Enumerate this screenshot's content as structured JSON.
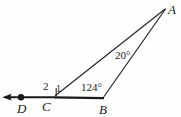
{
  "figure": {
    "background_color": "#fefefe",
    "stroke_color": "#1a1a1a",
    "points": {
      "A": {
        "label": "A",
        "x": 165,
        "y": 8
      },
      "B": {
        "label": "B",
        "x": 103,
        "y": 97
      },
      "C": {
        "label": "C",
        "x": 53,
        "y": 97
      },
      "D": {
        "label": "D",
        "x": 21,
        "y": 97
      },
      "arrow_tip": {
        "x": 3,
        "y": 97
      }
    },
    "segments": [
      {
        "name": "ray-CD",
        "from": "C",
        "to": "arrow_tip",
        "arrow": true
      },
      {
        "name": "segment-CB",
        "from": "C",
        "to": "B",
        "arrow": false
      },
      {
        "name": "segment-CA",
        "from": "C",
        "to": "A",
        "arrow": false
      },
      {
        "name": "segment-BA",
        "from": "B",
        "to": "A",
        "arrow": false
      }
    ],
    "angles": [
      {
        "name": "angle-2",
        "label": "2",
        "vertex": "C",
        "position": "left-of-C-above-ray"
      },
      {
        "name": "angle-1",
        "label": "1",
        "vertex": "C",
        "position": "right-of-C-above-ray"
      },
      {
        "name": "angle-B-exterior",
        "label": "124°",
        "vertex": "B",
        "value": 124,
        "unit": "degrees"
      },
      {
        "name": "angle-A",
        "label": "20°",
        "vertex": "A",
        "value": 20,
        "unit": "degrees"
      }
    ],
    "markers": [
      {
        "name": "point-dot-D",
        "shape": "filled-circle",
        "x": 21,
        "y": 97,
        "r": 3.1
      }
    ]
  }
}
